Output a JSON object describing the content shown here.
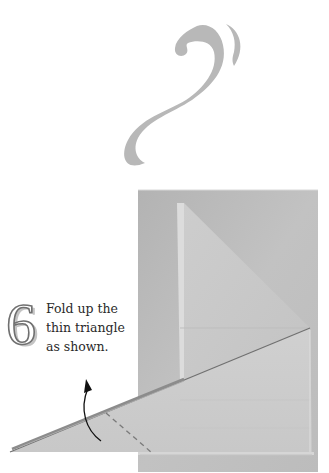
{
  "page": {
    "type": "origami-instruction",
    "decoration": "swirl-ornament"
  },
  "step": {
    "number": "6",
    "instruction_lines": [
      "Fold up the",
      "thin triangle",
      "as shown."
    ],
    "instruction": "Fold up the thin triangle as shown."
  },
  "diagram": {
    "elements": [
      "paper-photo",
      "fold-line-dashed",
      "curved-arrow-up"
    ],
    "colors": {
      "paper_back": "#bdbdbd",
      "paper_front": "#cfcfcf",
      "triangle": "#c6c6c6",
      "ornament": "#b8b8b8",
      "arrow": "#111111",
      "dashed_line": "#808080"
    }
  }
}
